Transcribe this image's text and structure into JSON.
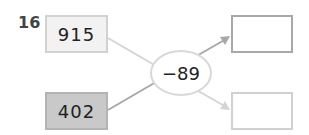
{
  "problem": {
    "number": "16",
    "inputs": [
      {
        "value": "915",
        "fill": "#f2f2f2"
      },
      {
        "value": "402",
        "fill": "#c9c9c9"
      }
    ],
    "operator": "−89",
    "outputs": [
      {
        "value": ""
      },
      {
        "value": ""
      }
    ],
    "colors": {
      "line_light": "#d4d4d4",
      "line_dark": "#a8a8a8",
      "ellipse_border": "#d8d8d8"
    }
  }
}
